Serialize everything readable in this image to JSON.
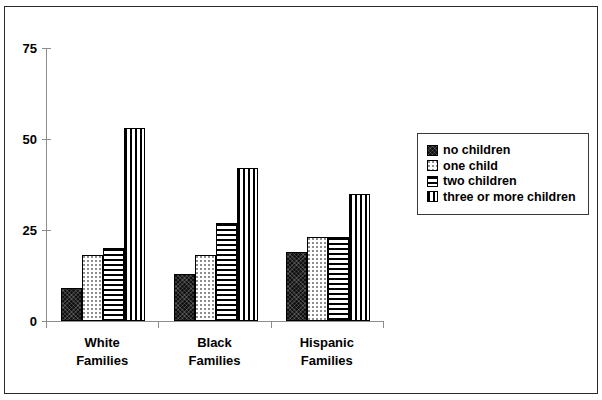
{
  "chart_data": {
    "type": "bar",
    "title": "",
    "subtitle": "",
    "xlabel": "",
    "ylabel": "",
    "ylim": [
      0,
      75
    ],
    "yticks": [
      0,
      25,
      50,
      75
    ],
    "ytick_labels": [
      "0",
      "25",
      "50",
      "75"
    ],
    "grid": false,
    "legend_position": "right",
    "categories": [
      "White\nFamilies",
      "Black\nFamilies",
      "Hispanic\nFamilies"
    ],
    "series": [
      {
        "name": "no children",
        "pattern": "solid-black",
        "values": [
          9,
          13,
          19
        ]
      },
      {
        "name": "one child",
        "pattern": "light-dots",
        "values": [
          18,
          18,
          23
        ]
      },
      {
        "name": "two children",
        "pattern": "horizontal-lines",
        "values": [
          20,
          27,
          23
        ]
      },
      {
        "name": "three or more children",
        "pattern": "vertical-lines",
        "values": [
          53,
          42,
          35
        ]
      }
    ]
  },
  "legend": {
    "items": [
      {
        "label": "no children"
      },
      {
        "label": "one child"
      },
      {
        "label": "two children"
      },
      {
        "label": "three or more children"
      }
    ]
  },
  "axis": {
    "y_labels": [
      "75",
      "50",
      "25",
      "0"
    ]
  },
  "categories": [
    {
      "label": "White\nFamilies"
    },
    {
      "label": "Black\nFamilies"
    },
    {
      "label": "Hispanic\nFamilies"
    }
  ],
  "colors": {
    "ink": "#000000",
    "axis": "#8d8d8d",
    "frame": "#2b2b2b",
    "background": "#ffffff"
  }
}
